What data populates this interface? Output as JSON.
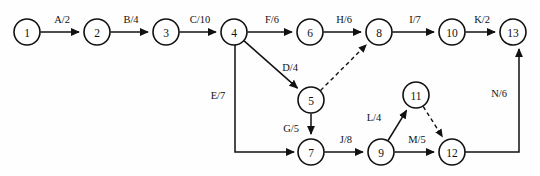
{
  "diagram": {
    "type": "directed-network",
    "background_color": "#fefefe",
    "line_color": "#111111",
    "node_fill": "#ffffff",
    "node_radius": 13,
    "nodes": [
      {
        "id": "1",
        "label": "1",
        "x": 27,
        "y": 32
      },
      {
        "id": "2",
        "label": "2",
        "x": 97,
        "y": 32
      },
      {
        "id": "3",
        "label": "3",
        "x": 166,
        "y": 32
      },
      {
        "id": "4",
        "label": "4",
        "x": 234,
        "y": 32
      },
      {
        "id": "6",
        "label": "6",
        "x": 310,
        "y": 32
      },
      {
        "id": "8",
        "label": "8",
        "x": 379,
        "y": 32
      },
      {
        "id": "10",
        "label": "10",
        "x": 452,
        "y": 32
      },
      {
        "id": "13",
        "label": "13",
        "x": 513,
        "y": 32
      },
      {
        "id": "5",
        "label": "5",
        "x": 311,
        "y": 100
      },
      {
        "id": "11",
        "label": "11",
        "x": 416,
        "y": 95
      },
      {
        "id": "7",
        "label": "7",
        "x": 311,
        "y": 152
      },
      {
        "id": "9",
        "label": "9",
        "x": 381,
        "y": 152
      },
      {
        "id": "12",
        "label": "12",
        "x": 452,
        "y": 152
      }
    ],
    "edges": [
      {
        "from": "1",
        "to": "2",
        "label": "A/2",
        "style": "solid",
        "label_x": 62,
        "label_y": 19
      },
      {
        "from": "2",
        "to": "3",
        "label": "B/4",
        "style": "solid",
        "label_x": 131,
        "label_y": 19
      },
      {
        "from": "3",
        "to": "4",
        "label": "C/10",
        "style": "solid",
        "label_x": 200,
        "label_y": 19
      },
      {
        "from": "4",
        "to": "6",
        "label": "F/6",
        "style": "solid",
        "label_x": 272,
        "label_y": 19
      },
      {
        "from": "6",
        "to": "8",
        "label": "H/6",
        "style": "solid",
        "label_x": 344,
        "label_y": 19
      },
      {
        "from": "8",
        "to": "10",
        "label": "I/7",
        "style": "solid",
        "label_x": 415,
        "label_y": 19
      },
      {
        "from": "10",
        "to": "13",
        "label": "K/2",
        "style": "solid",
        "label_x": 482,
        "label_y": 19
      },
      {
        "from": "4",
        "to": "5",
        "label": "D/4",
        "style": "solid",
        "label_x": 290,
        "label_y": 67
      },
      {
        "from": "5",
        "to": "8",
        "label": "",
        "style": "dashed",
        "label_x": 0,
        "label_y": 0
      },
      {
        "from": "4",
        "to": "7",
        "label": "E/7",
        "style": "solid",
        "label_x": 218,
        "label_y": 95,
        "path": "elbow-down-right"
      },
      {
        "from": "5",
        "to": "7",
        "label": "G/5",
        "style": "solid",
        "label_x": 291,
        "label_y": 128
      },
      {
        "from": "7",
        "to": "9",
        "label": "J/8",
        "style": "solid",
        "label_x": 346,
        "label_y": 139
      },
      {
        "from": "9",
        "to": "11",
        "label": "L/4",
        "style": "solid",
        "label_x": 374,
        "label_y": 117
      },
      {
        "from": "9",
        "to": "12",
        "label": "M/5",
        "style": "solid",
        "label_x": 417,
        "label_y": 139
      },
      {
        "from": "11",
        "to": "12",
        "label": "",
        "style": "dashed",
        "label_x": 0,
        "label_y": 0
      },
      {
        "from": "12",
        "to": "13",
        "label": "N/6",
        "style": "solid",
        "label_x": 499,
        "label_y": 93,
        "path": "elbow-right-up"
      }
    ]
  }
}
